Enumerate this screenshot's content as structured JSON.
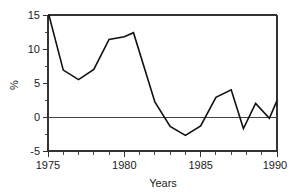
{
  "chart_data": {
    "type": "line",
    "title": "",
    "subtitle": "",
    "xlabel": "Years",
    "ylabel": "%",
    "xlim": [
      1975,
      1990
    ],
    "ylim": [
      -5,
      15
    ],
    "grid": false,
    "legend": false,
    "zero_line": true,
    "x_major_ticks": [
      1975,
      1980,
      1985,
      1990
    ],
    "x_major_tick_labels": [
      "1975",
      "1980",
      "1985",
      "1990"
    ],
    "x_minor_tick_interval": 1,
    "y_ticks": [
      -5,
      0,
      5,
      10,
      15
    ],
    "y_tick_labels": [
      "-5",
      "0",
      "5",
      "10",
      "15"
    ],
    "note": "First point is clipped by the top axis at 15%",
    "series": [
      {
        "name": "annual-rate",
        "color": "#111111",
        "x": [
          1975,
          1976,
          1977,
          1978,
          1979,
          1980,
          1980.6,
          1982,
          1983,
          1984,
          1985,
          1986,
          1987,
          1987.8,
          1988.6,
          1989.5,
          1990
        ],
        "values": [
          15.5,
          6.9,
          5.5,
          7.0,
          11.4,
          11.8,
          12.4,
          2.2,
          -1.4,
          -2.7,
          -1.3,
          2.9,
          4.0,
          -1.7,
          2.0,
          -0.2,
          2.4
        ]
      }
    ]
  },
  "axis_labels": {
    "x_title": "Years",
    "y_title": "%"
  }
}
